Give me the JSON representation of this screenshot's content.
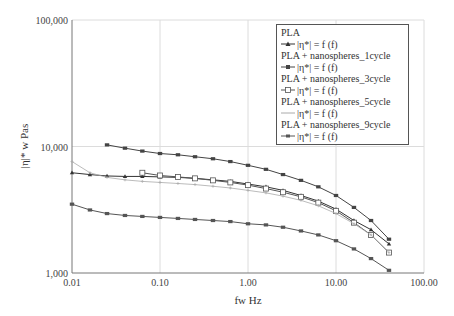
{
  "chart_data": {
    "type": "line",
    "title": "",
    "xlabel": "fw Hz",
    "ylabel": "|η|* w Pas",
    "xscale": "log",
    "yscale": "log",
    "xlim": [
      0.01,
      100
    ],
    "ylim": [
      1000,
      100000
    ],
    "x_ticks": [
      "0.01",
      "0.10",
      "1.00",
      "10.00",
      "100.00"
    ],
    "y_ticks": [
      "1,000",
      "10,000",
      "100,000"
    ],
    "grid": true,
    "legend_position": "upper right",
    "series": [
      {
        "name": "PLA",
        "formula": "|η*| = f (f)",
        "marker": "filled-triangle",
        "color": "#333333",
        "x": [
          0.01,
          0.016,
          0.025,
          0.04,
          0.063,
          0.1,
          0.16,
          0.25,
          0.4,
          0.63,
          1.0,
          1.6,
          2.5,
          4.0,
          6.3,
          10,
          16,
          25,
          40
        ],
        "y": [
          6200,
          6000,
          5850,
          5800,
          5800,
          5750,
          5700,
          5600,
          5450,
          5300,
          5050,
          4800,
          4500,
          4100,
          3700,
          3200,
          2600,
          2200,
          1700
        ]
      },
      {
        "name": "PLA + nanospheres_1cycle",
        "formula": "|η*| = f (f)",
        "marker": "filled-square",
        "color": "#444444",
        "x": [
          0.025,
          0.04,
          0.063,
          0.1,
          0.16,
          0.25,
          0.4,
          0.63,
          1.0,
          1.6,
          2.5,
          4.0,
          6.3,
          10,
          16,
          25,
          40
        ],
        "y": [
          10300,
          9700,
          9200,
          8800,
          8600,
          8300,
          8000,
          7600,
          7100,
          6600,
          6000,
          5400,
          4800,
          4100,
          3300,
          2600,
          1850
        ]
      },
      {
        "name": "PLA + nanospheres_3cycle",
        "formula": "|η*| = f (f)",
        "marker": "open-square",
        "color": "#555555",
        "x": [
          0.063,
          0.1,
          0.16,
          0.25,
          0.4,
          0.63,
          1.0,
          1.6,
          2.5,
          4.0,
          6.3,
          10,
          16,
          25,
          40
        ],
        "y": [
          6200,
          5900,
          5750,
          5600,
          5400,
          5200,
          4950,
          4650,
          4350,
          4000,
          3600,
          3100,
          2500,
          2000,
          1450
        ]
      },
      {
        "name": "PLA + nanospheres_5cycle",
        "formula": "|η*| = f (f)",
        "marker": "plus",
        "color": "#aaaaaa",
        "x": [
          0.01,
          0.016,
          0.025,
          0.04,
          0.063,
          0.1,
          0.16,
          0.25,
          0.4,
          0.63,
          1.0,
          1.6,
          2.5,
          4.0,
          6.3,
          10,
          16,
          25,
          40
        ],
        "y": [
          7600,
          6200,
          5700,
          5450,
          5300,
          5200,
          5100,
          5000,
          4850,
          4700,
          4500,
          4300,
          4050,
          3750,
          3400,
          2950,
          2450,
          2000,
          1450
        ]
      },
      {
        "name": "PLA + nanospheres_9cycle",
        "formula": "|η*| = f (f)",
        "marker": "filled-square",
        "color": "#555555",
        "x": [
          0.01,
          0.016,
          0.025,
          0.04,
          0.063,
          0.1,
          0.16,
          0.25,
          0.4,
          0.63,
          1.0,
          1.6,
          2.5,
          4.0,
          6.3,
          10,
          16,
          25,
          40
        ],
        "y": [
          3500,
          3150,
          2950,
          2850,
          2800,
          2750,
          2700,
          2650,
          2600,
          2550,
          2450,
          2400,
          2300,
          2150,
          2000,
          1800,
          1550,
          1300,
          1050
        ]
      }
    ]
  },
  "legend": {
    "items": [
      {
        "name": "PLA",
        "formula": "|η*| = f (f)"
      },
      {
        "name": "PLA + nanospheres_1cycle",
        "formula": "|η*| = f (f)"
      },
      {
        "name": "PLA + nanospheres_3cycle",
        "formula": "|η*| = f (f)"
      },
      {
        "name": "PLA + nanospheres_5cycle",
        "formula": "|η*| = f (f)"
      },
      {
        "name": "PLA + nanospheres_9cycle",
        "formula": "|η*| = f (f)"
      }
    ]
  }
}
